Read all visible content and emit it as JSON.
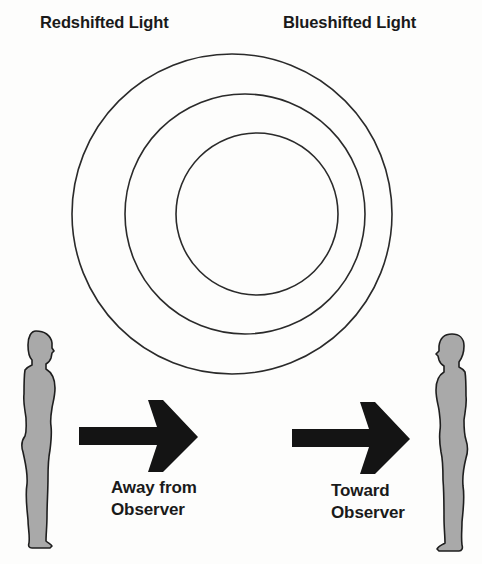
{
  "title_left": "Redshifted Light",
  "title_right": "Blueshifted Light",
  "left_caption": {
    "line1": "Away from",
    "line2": "Observer"
  },
  "right_caption": {
    "line1": "Toward",
    "line2": "Observer"
  },
  "wavefronts": [
    {
      "cx": 232,
      "cy": 214,
      "r": 160
    },
    {
      "cx": 245,
      "cy": 214,
      "r": 120
    },
    {
      "cx": 257,
      "cy": 214,
      "r": 81
    }
  ],
  "colors": {
    "line": "#2a2a2a",
    "figure_fill": "#a9a9a9",
    "figure_outline": "#1e1e1e",
    "arrow": "#141414",
    "background": "#fdfdfc"
  }
}
